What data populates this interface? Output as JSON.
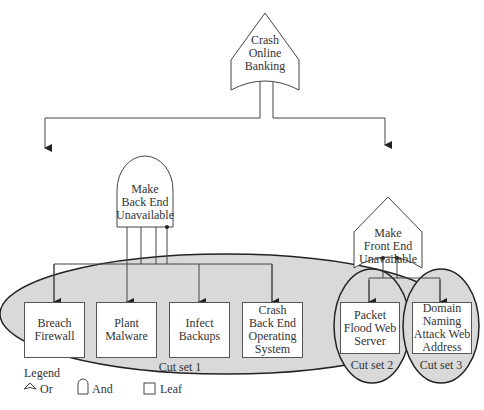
{
  "diagram": {
    "type": "attack-tree",
    "root": {
      "label": "Crash Online Banking",
      "gate": "or"
    },
    "gates": [
      {
        "id": "back_end",
        "label": "Make Back End Unavailable",
        "gate": "and"
      },
      {
        "id": "front_end",
        "label": "Make Front End Unavailable",
        "gate": "or"
      }
    ],
    "leaves": [
      {
        "label": "Breach Firewall",
        "parent": "back_end",
        "cut_set": 1
      },
      {
        "label": "Plant Malware",
        "parent": "back_end",
        "cut_set": 1
      },
      {
        "label": "Infect Backups",
        "parent": "back_end",
        "cut_set": 1
      },
      {
        "label": "Crash Back End Operating System",
        "parent": "back_end",
        "cut_set": 1
      },
      {
        "label": "Packet Flood Web Server",
        "parent": "front_end",
        "cut_set": 2
      },
      {
        "label": "Domain Naming Attack Web Address",
        "parent": "front_end",
        "cut_set": 3
      }
    ],
    "cut_sets": [
      "Cut set 1",
      "Cut set 2",
      "Cut set 3"
    ],
    "colors": {
      "cut_set_fill": "#d9d9d9",
      "line": "#444444",
      "box_fill": "#ffffff"
    }
  },
  "labels": {
    "root": [
      "Crash",
      "Online",
      "Banking"
    ],
    "back_end": [
      "Make",
      "Back End",
      "Unavailable"
    ],
    "front_end": [
      "Make",
      "Front End",
      "Unavailable"
    ],
    "leaf1": [
      "Breach",
      "Firewall"
    ],
    "leaf2": [
      "Plant",
      "Malware"
    ],
    "leaf3": [
      "Infect",
      "Backups"
    ],
    "leaf4": [
      "Crash",
      "Back End",
      "Operating",
      "System"
    ],
    "leaf5": [
      "Packet",
      "Flood Web",
      "Server"
    ],
    "leaf6": [
      "Domain",
      "Naming",
      "Attack Web",
      "Address"
    ],
    "cut1": "Cut set 1",
    "cut2": "Cut set 2",
    "cut3": "Cut set 3"
  },
  "legend": {
    "title": "Legend",
    "items": [
      {
        "icon": "or-gate-icon",
        "label": "Or"
      },
      {
        "icon": "and-gate-icon",
        "label": "And"
      },
      {
        "icon": "leaf-icon",
        "label": "Leaf"
      }
    ]
  }
}
